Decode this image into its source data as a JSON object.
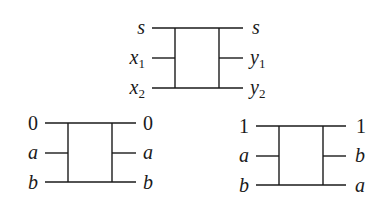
{
  "gates": [
    {
      "id": "general",
      "inputs": [
        {
          "name": "s",
          "sub": ""
        },
        {
          "name": "x",
          "sub": "1"
        },
        {
          "name": "x",
          "sub": "2"
        }
      ],
      "outputs": [
        {
          "name": "s",
          "sub": ""
        },
        {
          "name": "y",
          "sub": "1"
        },
        {
          "name": "y",
          "sub": "2"
        }
      ]
    },
    {
      "id": "control-zero",
      "inputs": [
        {
          "name": "0",
          "sub": ""
        },
        {
          "name": "a",
          "sub": ""
        },
        {
          "name": "b",
          "sub": ""
        }
      ],
      "outputs": [
        {
          "name": "0",
          "sub": ""
        },
        {
          "name": "a",
          "sub": ""
        },
        {
          "name": "b",
          "sub": ""
        }
      ]
    },
    {
      "id": "control-one",
      "inputs": [
        {
          "name": "1",
          "sub": ""
        },
        {
          "name": "a",
          "sub": ""
        },
        {
          "name": "b",
          "sub": ""
        }
      ],
      "outputs": [
        {
          "name": "1",
          "sub": ""
        },
        {
          "name": "b",
          "sub": ""
        },
        {
          "name": "a",
          "sub": ""
        }
      ]
    }
  ]
}
